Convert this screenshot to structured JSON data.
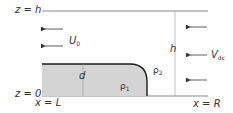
{
  "diagram": {
    "labels": {
      "z_top": "z = h",
      "z_bottom": "z = 0",
      "x_left": "x = L",
      "x_right": "x = R",
      "height": "h",
      "film_thickness": "d",
      "velocity_main": "U",
      "velocity_main_sub": "0",
      "velocity_side": "V",
      "velocity_side_sub": "dc",
      "density_liquid": "ρ",
      "density_liquid_sub": "1",
      "density_gas": "ρ",
      "density_gas_sub": "2"
    },
    "colors": {
      "line": "#8a8a8a",
      "liquid_fill": "#d4d4d4",
      "liquid_edge": "#1a1a1a",
      "text": "#333333"
    }
  }
}
